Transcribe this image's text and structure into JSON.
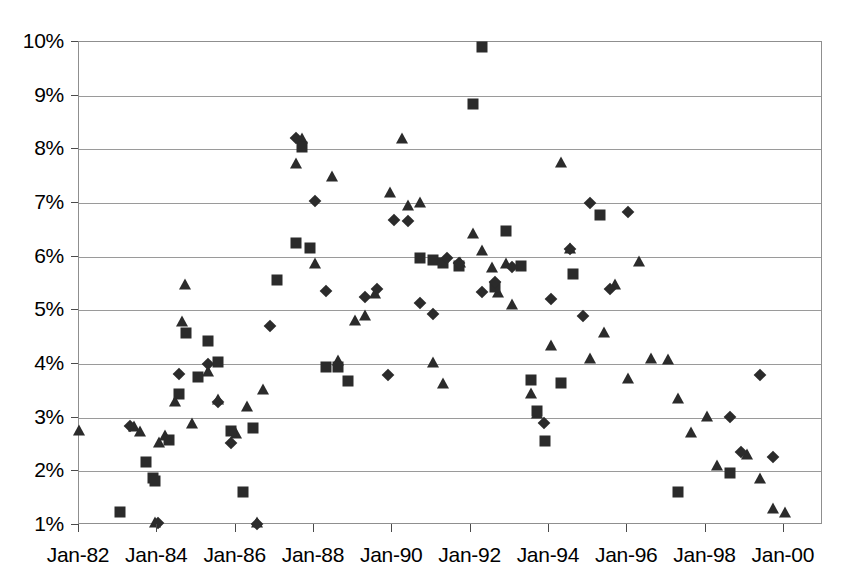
{
  "chart_data": {
    "type": "scatter",
    "title": "",
    "subtitle": "",
    "xlabel": "",
    "ylabel": "",
    "grid": true,
    "legend": "none",
    "ylim": [
      1,
      10
    ],
    "ytick_labels": [
      "10%",
      "9%",
      "8%",
      "7%",
      "6%",
      "5%",
      "4%",
      "3%",
      "2%",
      "1%"
    ],
    "ytick_values": [
      10,
      9,
      8,
      7,
      6,
      5,
      4,
      3,
      2,
      1
    ],
    "xlim": [
      "Jan-82",
      "Jan-01"
    ],
    "xtick_labels": [
      "Jan-82",
      "Jan-84",
      "Jan-86",
      "Jan-88",
      "Jan-90",
      "Jan-92",
      "Jan-94",
      "Jan-96",
      "Jan-98",
      "Jan-00"
    ],
    "xtick_years": [
      1982,
      1984,
      1986,
      1988,
      1990,
      1992,
      1994,
      1996,
      1998,
      2000
    ],
    "x_unit": "year",
    "y_unit": "percent",
    "marker_color": "#2b2b2b",
    "series": [
      {
        "name": "series-triangle",
        "marker": "triangle",
        "points": [
          [
            1982.0,
            2.76
          ],
          [
            1983.4,
            2.82
          ],
          [
            1983.55,
            2.74
          ],
          [
            1983.95,
            1.04
          ],
          [
            1984.05,
            2.53
          ],
          [
            1984.2,
            2.66
          ],
          [
            1984.45,
            3.3
          ],
          [
            1984.62,
            4.78
          ],
          [
            1984.7,
            5.48
          ],
          [
            1984.88,
            2.88
          ],
          [
            1985.3,
            3.86
          ],
          [
            1985.55,
            3.32
          ],
          [
            1986.02,
            2.7
          ],
          [
            1986.3,
            3.2
          ],
          [
            1986.55,
            1.03
          ],
          [
            1986.7,
            3.52
          ],
          [
            1987.55,
            7.72
          ],
          [
            1987.7,
            8.2
          ],
          [
            1988.02,
            5.86
          ],
          [
            1988.45,
            7.48
          ],
          [
            1988.62,
            4.06
          ],
          [
            1989.05,
            4.8
          ],
          [
            1989.3,
            4.9
          ],
          [
            1989.55,
            5.3
          ],
          [
            1989.95,
            7.18
          ],
          [
            1990.25,
            8.2
          ],
          [
            1990.4,
            6.94
          ],
          [
            1990.72,
            7.0
          ],
          [
            1991.05,
            4.02
          ],
          [
            1991.3,
            3.62
          ],
          [
            1991.72,
            5.88
          ],
          [
            1992.05,
            6.42
          ],
          [
            1992.3,
            6.1
          ],
          [
            1992.55,
            5.78
          ],
          [
            1992.7,
            5.32
          ],
          [
            1992.9,
            5.86
          ],
          [
            1993.05,
            5.1
          ],
          [
            1993.55,
            3.44
          ],
          [
            1993.7,
            3.06
          ],
          [
            1994.05,
            4.34
          ],
          [
            1994.3,
            7.74
          ],
          [
            1994.55,
            6.14
          ],
          [
            1995.05,
            4.1
          ],
          [
            1995.4,
            4.58
          ],
          [
            1995.7,
            5.48
          ],
          [
            1996.02,
            3.72
          ],
          [
            1996.3,
            5.9
          ],
          [
            1996.62,
            4.1
          ],
          [
            1997.05,
            4.08
          ],
          [
            1997.3,
            3.34
          ],
          [
            1997.62,
            2.72
          ],
          [
            1998.05,
            3.02
          ],
          [
            1998.3,
            2.1
          ],
          [
            1999.05,
            2.3
          ],
          [
            1999.4,
            1.86
          ],
          [
            1999.72,
            1.3
          ],
          [
            2000.02,
            1.22
          ]
        ]
      },
      {
        "name": "series-square",
        "marker": "square",
        "points": [
          [
            1983.05,
            1.24
          ],
          [
            1983.7,
            2.18
          ],
          [
            1983.88,
            1.88
          ],
          [
            1983.95,
            1.82
          ],
          [
            1984.3,
            2.58
          ],
          [
            1984.55,
            3.44
          ],
          [
            1984.72,
            4.58
          ],
          [
            1985.05,
            3.76
          ],
          [
            1985.3,
            4.42
          ],
          [
            1985.55,
            4.04
          ],
          [
            1985.88,
            2.76
          ],
          [
            1986.2,
            1.62
          ],
          [
            1986.45,
            2.8
          ],
          [
            1987.05,
            5.56
          ],
          [
            1987.55,
            6.26
          ],
          [
            1987.7,
            8.04
          ],
          [
            1987.9,
            6.16
          ],
          [
            1988.3,
            3.94
          ],
          [
            1988.62,
            3.94
          ],
          [
            1988.88,
            3.68
          ],
          [
            1990.72,
            5.98
          ],
          [
            1991.05,
            5.94
          ],
          [
            1991.3,
            5.88
          ],
          [
            1991.7,
            5.82
          ],
          [
            1992.05,
            8.85
          ],
          [
            1992.3,
            9.9
          ],
          [
            1992.62,
            5.44
          ],
          [
            1992.9,
            6.48
          ],
          [
            1993.3,
            5.82
          ],
          [
            1993.55,
            3.7
          ],
          [
            1993.7,
            3.12
          ],
          [
            1993.9,
            2.56
          ],
          [
            1994.3,
            3.64
          ],
          [
            1994.62,
            5.68
          ],
          [
            1995.3,
            6.78
          ],
          [
            1997.3,
            1.62
          ],
          [
            1998.62,
            1.96
          ]
        ]
      },
      {
        "name": "series-diamond",
        "marker": "diamond",
        "points": [
          [
            1983.3,
            2.84
          ],
          [
            1984.02,
            1.04
          ],
          [
            1984.55,
            3.82
          ],
          [
            1985.3,
            4.0
          ],
          [
            1985.55,
            3.3
          ],
          [
            1985.88,
            2.52
          ],
          [
            1986.55,
            1.02
          ],
          [
            1986.88,
            4.7
          ],
          [
            1987.55,
            8.22
          ],
          [
            1988.02,
            7.04
          ],
          [
            1988.3,
            5.36
          ],
          [
            1989.3,
            5.24
          ],
          [
            1989.62,
            5.4
          ],
          [
            1989.88,
            3.8
          ],
          [
            1990.05,
            6.68
          ],
          [
            1990.4,
            6.66
          ],
          [
            1990.72,
            5.14
          ],
          [
            1991.05,
            4.94
          ],
          [
            1991.4,
            5.98
          ],
          [
            1991.7,
            5.88
          ],
          [
            1992.3,
            5.34
          ],
          [
            1992.62,
            5.52
          ],
          [
            1993.05,
            5.8
          ],
          [
            1993.88,
            2.9
          ],
          [
            1994.05,
            5.22
          ],
          [
            1994.55,
            6.14
          ],
          [
            1994.88,
            4.9
          ],
          [
            1995.05,
            7.0
          ],
          [
            1995.55,
            5.4
          ],
          [
            1996.02,
            6.84
          ],
          [
            1998.62,
            3.02
          ],
          [
            1998.9,
            2.36
          ],
          [
            1999.4,
            3.8
          ],
          [
            1999.72,
            2.26
          ]
        ]
      }
    ]
  },
  "axes": {
    "y_title": "",
    "x_title": ""
  }
}
